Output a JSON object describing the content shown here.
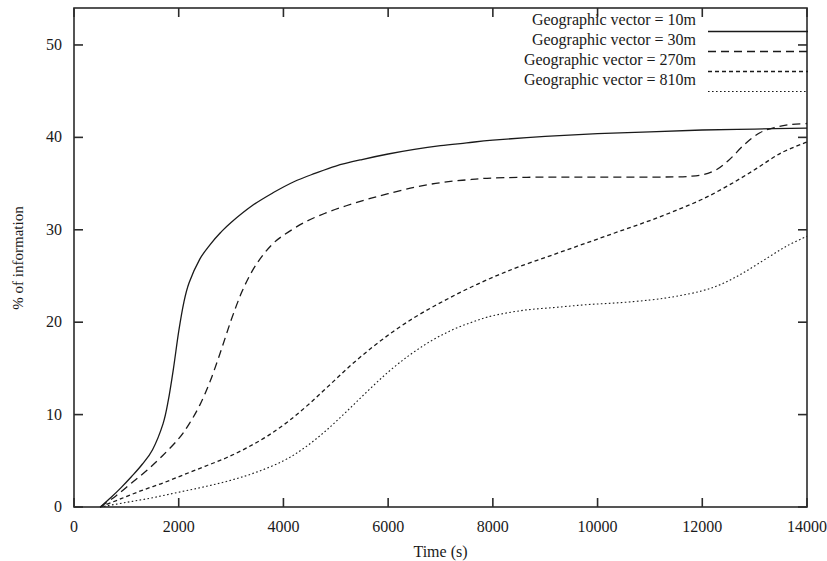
{
  "chart_data": {
    "type": "line",
    "title": "",
    "xlabel": "Time (s)",
    "ylabel": "% of information",
    "xlim": [
      0,
      14000
    ],
    "ylim": [
      0,
      54
    ],
    "xticks": [
      0,
      2000,
      4000,
      6000,
      8000,
      10000,
      12000,
      14000
    ],
    "xtick_labels": [
      "0",
      "2000",
      "4000",
      "6000",
      "8000",
      "10000",
      "12000",
      "14000"
    ],
    "yticks": [
      0,
      10,
      20,
      30,
      40,
      50
    ],
    "ytick_labels": [
      "0",
      "10",
      "20",
      "30",
      "40",
      "50"
    ],
    "grid": false,
    "legend_position": "top-right",
    "series": [
      {
        "name": "Geographic vector = 10m",
        "label": "Geographic vector = 10m",
        "style": "solid",
        "dash": "none",
        "color": "#1a1a1a",
        "x": [
          500,
          700,
          900,
          1100,
          1300,
          1500,
          1700,
          1800,
          1900,
          2000,
          2100,
          2200,
          2400,
          2600,
          2800,
          3000,
          3400,
          3800,
          4200,
          4600,
          5000,
          5500,
          6000,
          6500,
          7000,
          7500,
          8000,
          9000,
          10000,
          11000,
          12000,
          13000,
          14000
        ],
        "y": [
          0,
          1.0,
          2.1,
          3.3,
          4.6,
          6.2,
          9.0,
          11.5,
          15.0,
          19.0,
          22.2,
          24.3,
          26.8,
          28.4,
          29.7,
          30.8,
          32.6,
          34.0,
          35.2,
          36.1,
          36.9,
          37.6,
          38.2,
          38.7,
          39.1,
          39.4,
          39.7,
          40.1,
          40.4,
          40.6,
          40.8,
          40.9,
          41.0
        ]
      },
      {
        "name": "Geographic vector = 30m",
        "label": "Geographic vector = 30m",
        "style": "dashed",
        "dash": "8,5",
        "color": "#1a1a1a",
        "x": [
          500,
          800,
          1100,
          1400,
          1700,
          2000,
          2200,
          2400,
          2600,
          2800,
          3000,
          3200,
          3400,
          3600,
          3800,
          4000,
          4400,
          4800,
          5200,
          5600,
          6000,
          6500,
          7000,
          7500,
          8000,
          9000,
          10000,
          11000,
          11800,
          12200,
          12500,
          12800,
          13100,
          13400,
          13700,
          14000
        ],
        "y": [
          0,
          1.2,
          2.6,
          4.0,
          5.6,
          7.4,
          9.0,
          11.0,
          13.6,
          16.8,
          20.2,
          23.2,
          25.5,
          27.2,
          28.5,
          29.4,
          30.8,
          31.8,
          32.6,
          33.3,
          33.9,
          34.6,
          35.1,
          35.4,
          35.6,
          35.7,
          35.7,
          35.7,
          35.8,
          36.3,
          37.5,
          39.2,
          40.5,
          41.1,
          41.4,
          41.5
        ]
      },
      {
        "name": "Geographic vector = 270m",
        "label": "Geographic vector = 270m",
        "style": "short-dash",
        "dash": "4,3",
        "color": "#1a1a1a",
        "x": [
          500,
          900,
          1300,
          1700,
          2100,
          2500,
          2900,
          3300,
          3700,
          4100,
          4500,
          4900,
          5300,
          5700,
          6100,
          6500,
          6900,
          7300,
          7700,
          8100,
          8500,
          9000,
          9500,
          10000,
          10500,
          11000,
          11500,
          12000,
          12500,
          13000,
          13500,
          14000
        ],
        "y": [
          0,
          0.9,
          1.8,
          2.6,
          3.5,
          4.4,
          5.3,
          6.4,
          7.7,
          9.3,
          11.2,
          13.3,
          15.4,
          17.3,
          19.0,
          20.5,
          21.8,
          23.0,
          24.1,
          25.1,
          26.0,
          27.0,
          28.0,
          29.0,
          30.0,
          31.0,
          32.1,
          33.3,
          34.8,
          36.5,
          38.3,
          39.5
        ]
      },
      {
        "name": "Geographic vector = 810m",
        "label": "Geographic vector = 810m",
        "style": "dotted",
        "dash": "1.6,2.4",
        "color": "#1a1a1a",
        "x": [
          500,
          1000,
          1500,
          2000,
          2500,
          3000,
          3500,
          4000,
          4400,
          4800,
          5200,
          5600,
          6000,
          6400,
          6800,
          7200,
          7600,
          8000,
          8600,
          9200,
          9800,
          10400,
          11000,
          11500,
          12000,
          12400,
          12800,
          13200,
          13600,
          14000
        ],
        "y": [
          0,
          0.5,
          1.0,
          1.6,
          2.2,
          2.9,
          3.8,
          5.0,
          6.4,
          8.2,
          10.3,
          12.5,
          14.6,
          16.4,
          17.9,
          19.1,
          20.0,
          20.7,
          21.3,
          21.6,
          21.9,
          22.1,
          22.4,
          22.8,
          23.4,
          24.2,
          25.4,
          26.8,
          28.2,
          29.3
        ]
      }
    ]
  },
  "axes": {
    "frame_color": "#2b2b2b"
  }
}
